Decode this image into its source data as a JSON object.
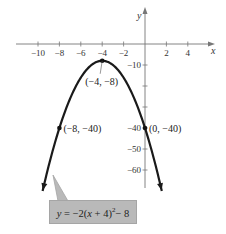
{
  "chart_data": {
    "type": "line",
    "title": "",
    "equation": "y = -2(x + 4)^2 - 8",
    "equation_parts": {
      "lhs": "y",
      "eq": " = −2(",
      "var": "x",
      "mid": " + 4)",
      "exp": "2",
      "tail": "− 8"
    },
    "xlabel": "x",
    "ylabel": "y",
    "xlim": [
      -12,
      6
    ],
    "ylim": [
      -70,
      5
    ],
    "x_ticks": [
      -10,
      -8,
      -6,
      -4,
      -2,
      2,
      4
    ],
    "x_tick_labels": [
      "−10",
      "−8",
      "−6",
      "−4",
      "−2",
      "2",
      "4"
    ],
    "y_ticks": [
      -10,
      -20,
      -30,
      -40,
      -50,
      -60
    ],
    "y_tick_labels": [
      "−10",
      "",
      "",
      "−40",
      "−50",
      "−60"
    ],
    "grid": false,
    "series": [
      {
        "name": "y = -2(x + 4)^2 - 8",
        "function": "-2*(x+4)^2-8",
        "x_range": [
          -9.57,
          1.57
        ],
        "arrows_at_ends": true,
        "color": "#1a1a1a"
      }
    ],
    "points": [
      {
        "x": -4,
        "y": -8,
        "label": "(−4, −8)"
      },
      {
        "x": -8,
        "y": -40,
        "label": "(−8, −40)"
      },
      {
        "x": 0,
        "y": -40,
        "label": "(0, −40)"
      }
    ]
  },
  "callout": {
    "bg": "#b9b9b9"
  }
}
